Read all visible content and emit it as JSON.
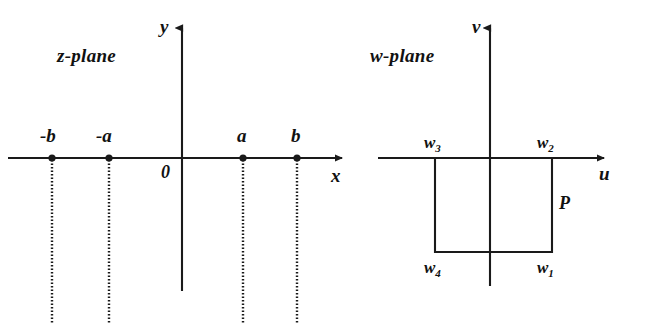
{
  "figure": {
    "background_color": "#ffffff",
    "ink_color": "#1a1a1a",
    "width": 649,
    "height": 323
  },
  "z_plane": {
    "title": "z-plane",
    "axes": {
      "horizontal_label": "x",
      "vertical_label": "y",
      "origin_label": "0"
    },
    "points": [
      {
        "label": "-b",
        "x": -2.0
      },
      {
        "label": "-a",
        "x": -1.0
      },
      {
        "label": "a",
        "x": 1.35
      },
      {
        "label": "b",
        "x": 2.3
      }
    ],
    "branch_cuts_note": "vertical dotted rays descending from each marked point"
  },
  "w_plane": {
    "title": "w-plane",
    "axes": {
      "horizontal_label": "u",
      "vertical_label": "v"
    },
    "region_label": "P",
    "corners": [
      {
        "label": "w",
        "sub": "1",
        "position": "bottom-right"
      },
      {
        "label": "w",
        "sub": "2",
        "position": "top-right"
      },
      {
        "label": "w",
        "sub": "3",
        "position": "top-left"
      },
      {
        "label": "w",
        "sub": "4",
        "position": "bottom-left"
      }
    ]
  }
}
